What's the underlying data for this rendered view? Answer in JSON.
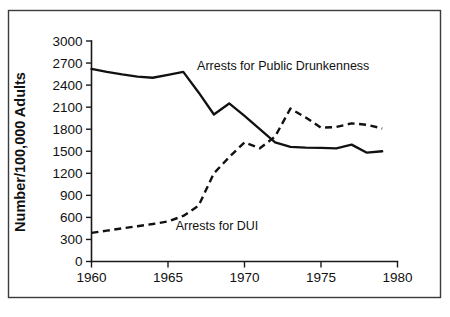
{
  "chart_data": {
    "type": "line",
    "title": "",
    "xlabel": "",
    "ylabel": "Number/100,000 Adults",
    "xlim": [
      1960,
      1980
    ],
    "ylim": [
      0,
      3000
    ],
    "grid": false,
    "legend_position": "inline-annotation",
    "x_ticks": [
      1960,
      1965,
      1970,
      1975,
      1980
    ],
    "x_tick_labels": [
      "1960",
      "1965",
      "1970",
      "1975",
      "1980"
    ],
    "y_ticks": [
      0,
      300,
      600,
      900,
      1200,
      1500,
      1800,
      2100,
      2400,
      2700,
      3000
    ],
    "y_tick_labels": [
      "0",
      "300",
      "600",
      "900",
      "1200",
      "1500",
      "1800",
      "2100",
      "2400",
      "2700",
      "3000"
    ],
    "x": [
      1960,
      1961,
      1962,
      1963,
      1964,
      1965,
      1966,
      1967,
      1968,
      1969,
      1970,
      1971,
      1972,
      1973,
      1974,
      1975,
      1976,
      1977,
      1978,
      1979
    ],
    "series": [
      {
        "name": "Arrests for Public Drunkenness",
        "style": "solid",
        "color": "#111111",
        "label_text": "Arrests for Public Drunkenness",
        "values": [
          2620,
          2580,
          2545,
          2515,
          2500,
          2540,
          2580,
          2300,
          2000,
          2150,
          1980,
          1800,
          1620,
          1560,
          1550,
          1545,
          1540,
          1590,
          1480,
          1500
        ]
      },
      {
        "name": "Arrests for DUI",
        "style": "dashed",
        "color": "#111111",
        "label_text": "Arrests for DUI",
        "values": [
          390,
          420,
          450,
          480,
          510,
          545,
          620,
          760,
          1200,
          1420,
          1620,
          1540,
          1700,
          2080,
          1960,
          1820,
          1830,
          1880,
          1860,
          1810
        ]
      }
    ],
    "annotations": [
      {
        "text": "Arrests for Public Drunkenness",
        "x": 1966.9,
        "y": 2600
      },
      {
        "text": "Arrests for DUI",
        "x": 1965.5,
        "y": 430
      }
    ]
  },
  "figure": {
    "background_color": "#ffffff",
    "frame_color": "#3b3b3b",
    "axis_color": "#1a1a1a"
  }
}
